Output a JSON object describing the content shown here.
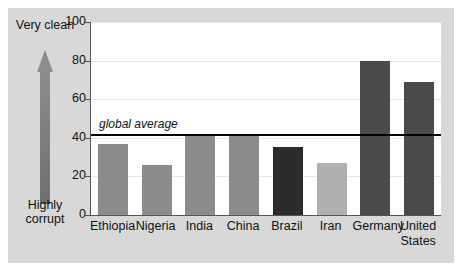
{
  "chart_data": {
    "type": "bar",
    "title": "",
    "xlabel": "",
    "ylabel": "",
    "ylim": [
      0,
      100
    ],
    "yticks": [
      0,
      20,
      40,
      60,
      80,
      100
    ],
    "grid": true,
    "legend": "none",
    "categories": [
      "Ethiopia",
      "Nigeria",
      "India",
      "China",
      "Brazil",
      "Iran",
      "Germany",
      "United States"
    ],
    "values": [
      37,
      26,
      41,
      41,
      35,
      27,
      80,
      69
    ],
    "bar_colors": [
      "#8c8c8c",
      "#8c8c8c",
      "#8c8c8c",
      "#8c8c8c",
      "#2b2b2b",
      "#b0b0b0",
      "#4a4a4a",
      "#4a4a4a"
    ],
    "annotations": [
      {
        "name": "global-average",
        "label": "global average",
        "value": 42,
        "type": "horizontal-line",
        "color": "#000000"
      }
    ],
    "axis_direction_scale": {
      "top_label": "Very clean",
      "bottom_label": "Highly corrupt",
      "arrow": "up-arrow"
    }
  },
  "colors": {
    "panel_background": "#d8d8d8",
    "plot_background": "#ffffff",
    "axis": "#555555",
    "gridline": "#e6e6e6",
    "average_line": "#000000",
    "arrow": "#8d8d8d",
    "text": "#111111"
  }
}
